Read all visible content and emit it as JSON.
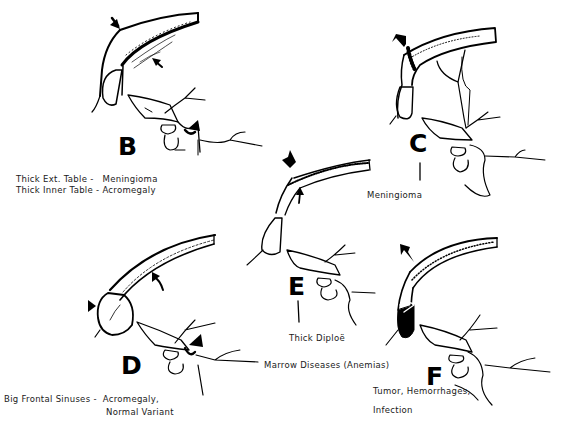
{
  "figure": {
    "panels": [
      {
        "id": "B",
        "letter": "B",
        "caption_line1": "Thick Ext. Table -   Meningioma",
        "caption_line2": "Thick Inner Table - Acromegaly"
      },
      {
        "id": "C",
        "letter": "C",
        "caption_line1": "Meningioma"
      },
      {
        "id": "D",
        "letter": "D",
        "caption_line1": "Big Frontal Sinuses -  Acromegaly,",
        "caption_line2": "Normal Variant"
      },
      {
        "id": "E",
        "letter": "E",
        "caption_line1": "Thick Diploë",
        "caption_line2": "Marrow Diseases (Anemias)"
      },
      {
        "id": "F",
        "letter": "F",
        "caption_line1": "Tumor, Hemorrhages,",
        "caption_line2": "Infection"
      }
    ],
    "colors": {
      "ink": "#000000",
      "background": "#ffffff"
    }
  }
}
